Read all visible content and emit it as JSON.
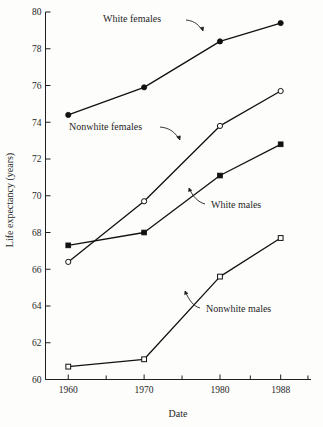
{
  "chart_data": {
    "type": "line",
    "title": "",
    "xlabel": "Date",
    "ylabel": "Life expectancy (years)",
    "x": [
      1960,
      1970,
      1980,
      1988
    ],
    "xtick_labels": [
      "1960",
      "1970",
      "1980",
      "1988"
    ],
    "ytick_labels": [
      "60",
      "62",
      "64",
      "66",
      "68",
      "70",
      "72",
      "74",
      "76",
      "78",
      "80"
    ],
    "ytick_values": [
      60,
      62,
      64,
      66,
      68,
      70,
      72,
      74,
      76,
      78,
      80
    ],
    "xlim": [
      1957,
      1992
    ],
    "ylim": [
      60,
      80
    ],
    "grid": false,
    "legend_position": "inline-annotations",
    "series": [
      {
        "name": "White females",
        "marker": "filled-circle",
        "values": [
          74.4,
          75.9,
          78.4,
          79.4
        ]
      },
      {
        "name": "Nonwhite females",
        "marker": "open-circle",
        "values": [
          66.4,
          69.7,
          73.8,
          75.7
        ]
      },
      {
        "name": "White males",
        "marker": "filled-square",
        "values": [
          67.3,
          68.0,
          71.1,
          72.8
        ]
      },
      {
        "name": "Nonwhite males",
        "marker": "open-square",
        "values": [
          60.7,
          61.1,
          65.6,
          67.7
        ]
      }
    ],
    "annotations": [
      {
        "label": "White females",
        "text_x": 103,
        "text_y": 22,
        "anchor": "start"
      },
      {
        "label": "Nonwhite females",
        "text_x": 69,
        "text_y": 130,
        "anchor": "start"
      },
      {
        "label": "White males",
        "text_x": 211,
        "text_y": 208,
        "anchor": "start"
      },
      {
        "label": "Nonwhite males",
        "text_x": 206,
        "text_y": 312,
        "anchor": "start"
      }
    ]
  }
}
